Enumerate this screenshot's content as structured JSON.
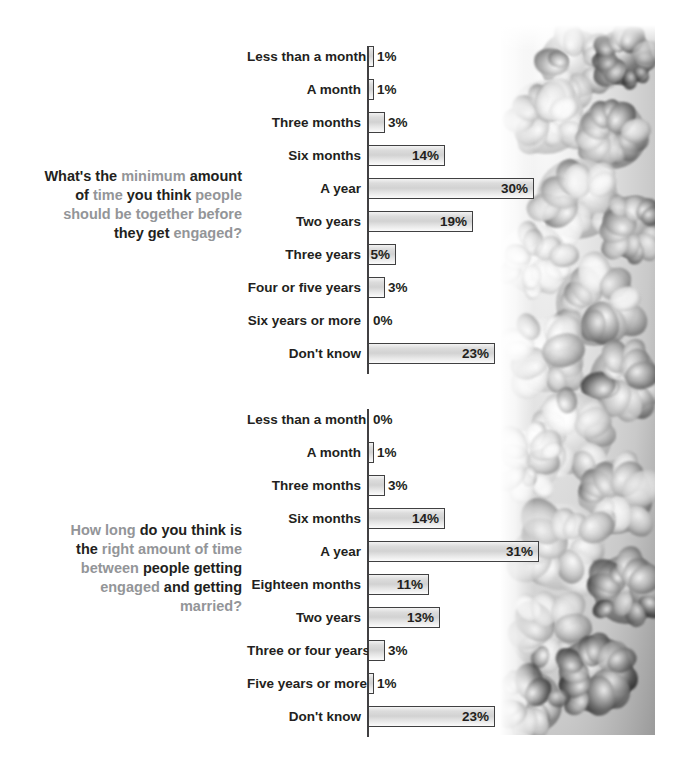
{
  "chart_data": [
    {
      "type": "bar",
      "orientation": "horizontal",
      "title": "What's the minimum amount of time you think people should be together before they get engaged?",
      "title_segments": [
        {
          "text": "What's the ",
          "style": "dark"
        },
        {
          "text": "minimum ",
          "style": "gray"
        },
        {
          "text": "amount",
          "style": "dark"
        },
        {
          "text": " of ",
          "style": "dark"
        },
        {
          "text": "time ",
          "style": "gray"
        },
        {
          "text": "you think ",
          "style": "dark"
        },
        {
          "text": "people",
          "style": "gray"
        },
        {
          "text": "should be together before",
          "style": "gray"
        },
        {
          "text": "they get ",
          "style": "dark"
        },
        {
          "text": "engaged?",
          "style": "gray"
        }
      ],
      "xlabel": "",
      "ylabel": "",
      "xlim": [
        0,
        31
      ],
      "grid": false,
      "legend": "none",
      "unit": "%",
      "categories": [
        "Less than a month",
        "A month",
        "Three months",
        "Six months",
        "A year",
        "Two years",
        "Three years",
        "Four or five years",
        "Six years or more",
        "Don't know"
      ],
      "values": [
        1,
        1,
        3,
        14,
        30,
        19,
        5,
        3,
        0,
        23
      ],
      "value_labels": [
        "1%",
        "1%",
        "3%",
        "14%",
        "30%",
        "19%",
        "5%",
        "3%",
        "0%",
        "23%"
      ],
      "label_placement": [
        "outside",
        "outside",
        "outside",
        "inside",
        "inside",
        "inside",
        "inside",
        "outside",
        "outside",
        "inside"
      ]
    },
    {
      "type": "bar",
      "orientation": "horizontal",
      "title": "How long do you think is the right amount of time between people getting engaged and getting married?",
      "title_segments": [
        {
          "text": "How long ",
          "style": "gray"
        },
        {
          "text": "do you think is",
          "style": "dark"
        },
        {
          "text": "the ",
          "style": "dark"
        },
        {
          "text": "right amount of time",
          "style": "gray"
        },
        {
          "text": "between ",
          "style": "gray"
        },
        {
          "text": "people getting",
          "style": "dark"
        },
        {
          "text": "engaged ",
          "style": "gray"
        },
        {
          "text": "and getting",
          "style": "dark"
        },
        {
          "text": "married?",
          "style": "gray"
        }
      ],
      "xlabel": "",
      "ylabel": "",
      "xlim": [
        0,
        31
      ],
      "grid": false,
      "legend": "none",
      "unit": "%",
      "categories": [
        "Less than a month",
        "A month",
        "Three months",
        "Six months",
        "A year",
        "Eighteen months",
        "Two years",
        "Three or four years",
        "Five years or more",
        "Don't know"
      ],
      "values": [
        0,
        1,
        3,
        14,
        31,
        11,
        13,
        3,
        1,
        23
      ],
      "value_labels": [
        "0%",
        "1%",
        "3%",
        "14%",
        "31%",
        "11%",
        "13%",
        "3%",
        "1%",
        "23%"
      ],
      "label_placement": [
        "outside",
        "outside",
        "outside",
        "inside",
        "inside",
        "inside",
        "inside",
        "outside",
        "outside",
        "inside"
      ]
    }
  ],
  "layout": {
    "px_per_percent": 5.52,
    "row_pitch": 33,
    "bar_height": 21,
    "colors": {
      "text_dark": "#231f20",
      "text_gray": "#939598",
      "bar_border": "#404041",
      "bar_fill_light": "#f6f6f6",
      "bar_fill_mid": "#d2d2d2",
      "axis": "#414042",
      "background": "#ffffff"
    }
  },
  "decoration": {
    "photo": {
      "name": "floral-photo-strip",
      "subject": "black and white photograph of peony and rose blossoms",
      "alt": "grayscale flowers"
    }
  }
}
